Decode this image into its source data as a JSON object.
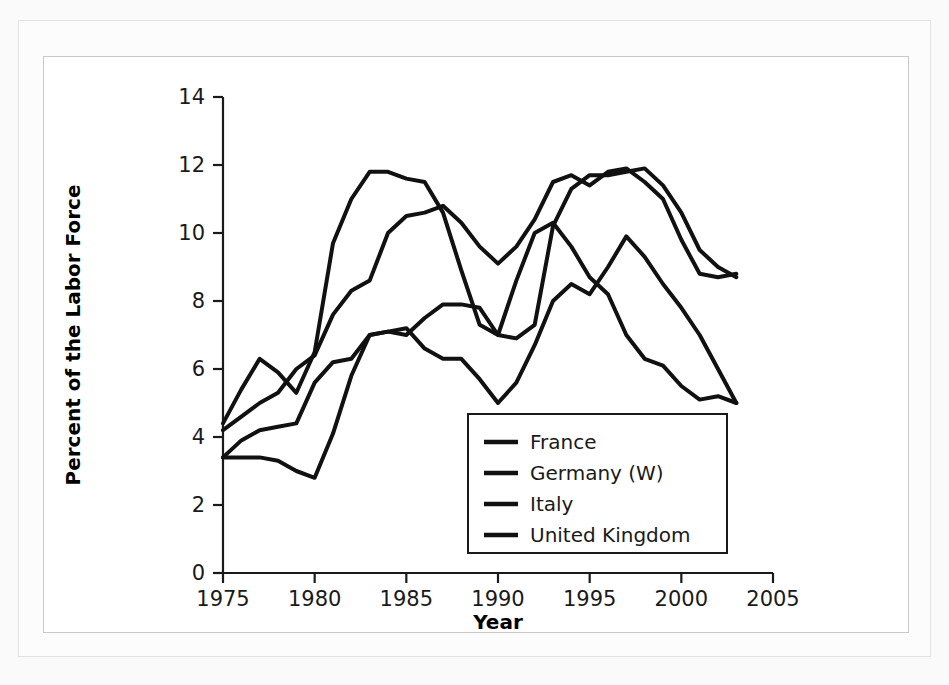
{
  "figure": {
    "background_color": "#ffffff",
    "frame_color": "#c9c9c9",
    "series_color": "#111111"
  },
  "chart_data": {
    "type": "line",
    "title": "",
    "subtitle": "",
    "xlabel": "Year",
    "ylabel": "Percent of the Labor Force",
    "xlim": [
      1975,
      2005
    ],
    "ylim": [
      0,
      14
    ],
    "xticks": [
      1975,
      1980,
      1985,
      1990,
      1995,
      2000,
      2005
    ],
    "xtick_labels": [
      "1975",
      "1980",
      "1985",
      "1990",
      "1995",
      "2000",
      "2005"
    ],
    "yticks": [
      0,
      2,
      4,
      6,
      8,
      10,
      12,
      14
    ],
    "ytick_labels": [
      "0",
      "2",
      "4",
      "6",
      "8",
      "10",
      "12",
      "14"
    ],
    "grid": false,
    "legend_position": "lower center",
    "legend_entries": [
      "France",
      "Germany (W)",
      "Italy",
      "United Kingdom"
    ],
    "x": [
      1975,
      1976,
      1977,
      1978,
      1979,
      1980,
      1981,
      1982,
      1983,
      1984,
      1985,
      1986,
      1987,
      1988,
      1989,
      1990,
      1991,
      1992,
      1993,
      1994,
      1995,
      1996,
      1997,
      1998,
      1999,
      2000,
      2001,
      2002,
      2003
    ],
    "series": [
      {
        "name": "France",
        "values": [
          4.2,
          4.6,
          5.0,
          5.3,
          6.0,
          6.4,
          7.6,
          8.3,
          8.6,
          10.0,
          10.5,
          10.6,
          10.8,
          10.3,
          9.6,
          9.1,
          9.6,
          10.4,
          11.5,
          11.7,
          11.4,
          11.8,
          11.9,
          11.5,
          11.0,
          9.8,
          8.8,
          8.7,
          8.8
        ]
      },
      {
        "name": "Germany (W)",
        "values": [
          3.4,
          3.4,
          3.4,
          3.3,
          3.0,
          2.8,
          4.1,
          5.8,
          7.0,
          7.1,
          7.2,
          6.6,
          6.3,
          6.3,
          5.7,
          5.0,
          5.6,
          6.7,
          8.0,
          8.5,
          8.2,
          9.0,
          9.9,
          9.3,
          8.5,
          7.8,
          7.0,
          6.0,
          5.0
        ]
      },
      {
        "name": "Italy",
        "values": [
          3.4,
          3.9,
          4.2,
          4.3,
          4.4,
          5.6,
          6.2,
          6.3,
          7.0,
          7.1,
          7.0,
          7.5,
          7.9,
          7.9,
          7.8,
          7.0,
          6.9,
          7.3,
          10.2,
          11.3,
          11.7,
          11.7,
          11.8,
          11.9,
          11.4,
          10.6,
          9.5,
          9.0,
          8.7
        ]
      },
      {
        "name": "United Kingdom",
        "values": [
          4.4,
          5.4,
          6.3,
          5.9,
          5.3,
          6.5,
          9.7,
          11.0,
          11.8,
          11.8,
          11.6,
          11.5,
          10.6,
          8.9,
          7.3,
          7.0,
          8.6,
          10.0,
          10.3,
          9.6,
          8.7,
          8.2,
          7.0,
          6.3,
          6.1,
          5.5,
          5.1,
          5.2,
          5.0
        ]
      }
    ]
  }
}
